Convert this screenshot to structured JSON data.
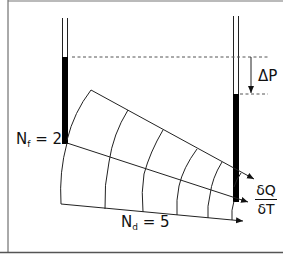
{
  "diagram": {
    "title": "",
    "type": "flow-net",
    "colors": {
      "line": "#222222",
      "fill": "#000000",
      "dashed": "#555555",
      "border": "#555555",
      "background": "#ffffff"
    },
    "labels": {
      "nf_symbol": "N",
      "nf_sub": "f",
      "nf_value": " = 2",
      "nd_symbol": "N",
      "nd_sub": "d",
      "nd_value": " = 5",
      "delta_p": "ΔP",
      "flow_rate_numerator": "δQ",
      "flow_rate_denominator": "δT"
    },
    "values": {
      "flow_channels_Nf": 2,
      "potential_drops_Nd": 5
    },
    "elements": [
      "left-standpipe",
      "right-standpipe",
      "head-difference-dashed-lines",
      "delta-p-arrow",
      "flow-lines",
      "equipotential-lines",
      "flow-arrows"
    ]
  }
}
